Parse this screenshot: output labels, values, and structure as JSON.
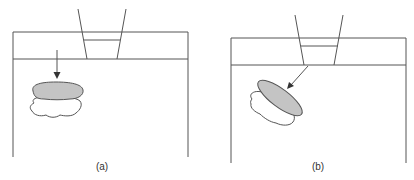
{
  "figure": {
    "panels": [
      {
        "id": "a",
        "label": "(a)",
        "description": "Funnel above container; arrow pointing straight down onto a gray layer stacked over a white cloud-shaped layer"
      },
      {
        "id": "b",
        "label": "(b)",
        "description": "Funnel above container; diagonal arrow pointing onto a tilted gray layer stacked over a tilted white cloud-shaped layer"
      }
    ],
    "colors": {
      "line": "#555555",
      "gray_fill": "#c4c4c4",
      "white_fill": "#ffffff",
      "background": "#ffffff"
    }
  }
}
